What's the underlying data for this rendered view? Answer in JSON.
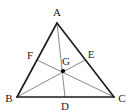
{
  "figure": {
    "width": 131,
    "height": 112,
    "background_color": "#ffffff",
    "edge_color": "#1a1a1a",
    "median_color": "#7a7a7a",
    "point_color": "#000000",
    "label_color": "#1a1a1a"
  },
  "labels": {
    "A": "A",
    "B": "B",
    "C": "C",
    "D": "D",
    "E": "E",
    "F": "F",
    "G": "G"
  },
  "points": {
    "A": {
      "name": "A",
      "x": 57,
      "y": 23,
      "label_x": 57,
      "label_y": 12,
      "role": "apex-vertex"
    },
    "B": {
      "name": "B",
      "x": 17,
      "y": 97,
      "label_x": 9,
      "label_y": 98,
      "role": "vertex"
    },
    "C": {
      "name": "C",
      "x": 114,
      "y": 97,
      "label_x": 122,
      "label_y": 98,
      "role": "vertex"
    },
    "D": {
      "name": "D",
      "x": 65,
      "y": 97,
      "label_x": 65,
      "label_y": 106,
      "role": "midpoint-of-BC"
    },
    "E": {
      "name": "E",
      "x": 85,
      "y": 60,
      "label_x": 91,
      "label_y": 54,
      "role": "midpoint-of-AC"
    },
    "F": {
      "name": "F",
      "x": 37,
      "y": 60,
      "label_x": 30,
      "label_y": 55,
      "role": "midpoint-of-AB"
    },
    "G": {
      "name": "G",
      "x": 63,
      "y": 71,
      "label_x": 66,
      "label_y": 61,
      "role": "centroid"
    }
  },
  "segments": [
    {
      "name": "side-AB",
      "from": "A",
      "to": "B",
      "kind": "triangle-side"
    },
    {
      "name": "side-AC",
      "from": "A",
      "to": "C",
      "kind": "triangle-side"
    },
    {
      "name": "side-BC",
      "from": "B",
      "to": "C",
      "kind": "triangle-side"
    },
    {
      "name": "median-AD",
      "from": "A",
      "to": "D",
      "kind": "median"
    },
    {
      "name": "median-BE",
      "from": "B",
      "to": "E",
      "kind": "median"
    },
    {
      "name": "median-CF",
      "from": "C",
      "to": "F",
      "kind": "median"
    }
  ]
}
